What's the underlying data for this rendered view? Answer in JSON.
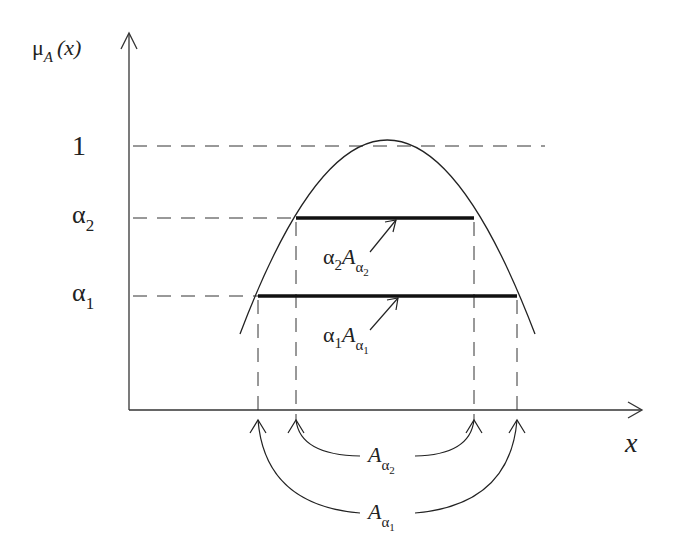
{
  "diagram": {
    "y_axis_label": {
      "main": "μ",
      "sub": "A",
      "arg": "(x)"
    },
    "x_axis_label": "x",
    "levels": [
      {
        "name": "one",
        "label": "1",
        "y": 1.0
      },
      {
        "name": "alpha2",
        "label": "α",
        "sub": "2"
      },
      {
        "name": "alpha1",
        "label": "α",
        "sub": "1"
      }
    ],
    "cut_labels": {
      "alpha2_cut": {
        "coef": "α",
        "coef_sub": "2",
        "set": "A",
        "set_sub": "α",
        "set_subsub": "2"
      },
      "alpha1_cut": {
        "coef": "α",
        "coef_sub": "1",
        "set": "A",
        "set_sub": "α",
        "set_subsub": "1"
      }
    },
    "interval_labels": {
      "alpha2_interval": {
        "set": "A",
        "set_sub": "α",
        "set_subsub": "2"
      },
      "alpha1_interval": {
        "set": "A",
        "set_sub": "α",
        "set_subsub": "1"
      }
    },
    "colors": {
      "line": "#222222",
      "background": "#ffffff"
    }
  }
}
